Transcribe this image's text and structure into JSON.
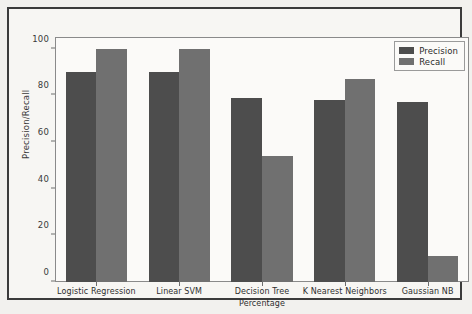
{
  "chart_data": {
    "type": "bar",
    "title": "",
    "xlabel": "Percentage",
    "ylabel": "Precision/Recall",
    "categories": [
      "Logistic Regression",
      "Linear SVM",
      "Decision Tree",
      "K Nearest Neighbors",
      "Gaussian NB"
    ],
    "series": [
      {
        "name": "Precision",
        "color": "#4d4d4d",
        "values": [
          90,
          90,
          79,
          78,
          77
        ]
      },
      {
        "name": "Recall",
        "color": "#707070",
        "values": [
          100,
          100,
          54,
          87,
          11
        ]
      }
    ],
    "ylim": [
      0,
      105
    ],
    "yticks": [
      0,
      20,
      40,
      60,
      80,
      100
    ],
    "ytick_labels": [
      "0",
      "20",
      "40",
      "60",
      "80",
      "100"
    ],
    "grid": false,
    "legend_position": "upper right"
  },
  "legend": {
    "entries": [
      {
        "label": "Precision",
        "color": "#4d4d4d"
      },
      {
        "label": "Recall",
        "color": "#707070"
      }
    ]
  },
  "style": {
    "background": "#f2f1ee",
    "figure_background": "#f7f6f3",
    "axes_background": "#fbfaf8",
    "frame_color": "#3b3b3b",
    "axis_color": "#8a8a8a",
    "text_color": "#2e2e2e"
  }
}
